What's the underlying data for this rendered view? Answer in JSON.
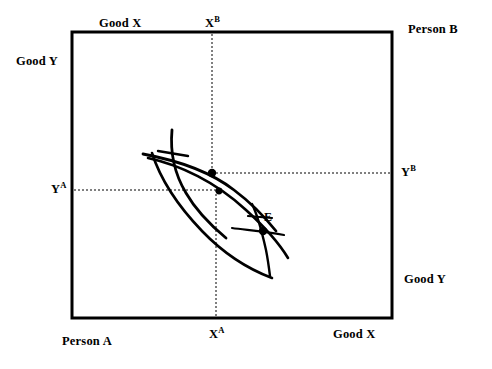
{
  "figure": {
    "type": "edgeworth-box",
    "background_color": "#ffffff",
    "stroke_color": "#000000"
  },
  "box": {
    "left": 72,
    "top": 32,
    "right": 392,
    "bottom": 318,
    "border_width": 3
  },
  "labels": {
    "good_x_top": "Good X",
    "x_b": "X",
    "x_b_sup": "B",
    "person_b": "Person B",
    "good_y_left": "Good Y",
    "y_a": "Y",
    "y_a_sup": "A",
    "y_b": "Y",
    "y_b_sup": "B",
    "equilibrium": "E",
    "good_y_right": "Good Y",
    "person_a": "Person A",
    "x_a": "X",
    "x_a_sup": "A",
    "good_x_bottom": "Good X"
  },
  "guides": {
    "x_b_line_x": 212,
    "x_a_line_x": 216,
    "y_a_line_y": 190,
    "y_b_line_y": 173,
    "dash_pattern": "2,2",
    "dash_width": 1
  },
  "points": [
    {
      "name": "tangency-upper",
      "x": 212,
      "y": 173,
      "r": 4.2
    },
    {
      "name": "tangency-lower",
      "x": 219,
      "y": 191,
      "r": 3.4
    },
    {
      "name": "equilibrium-E",
      "x": 263,
      "y": 231,
      "r": 4.2
    }
  ],
  "curves": [
    {
      "name": "indifference-curve-a-outer",
      "path": "M 148 158 C 180 165, 216 182, 246 210 C 268 230, 282 248, 288 258"
    },
    {
      "name": "indifference-curve-b-outer",
      "path": "M 152 153 C 160 178, 178 206, 202 231 C 228 258, 256 272, 272 278"
    },
    {
      "name": "indifference-curve-a-inner",
      "path": "M 143 154 C 175 160, 208 170, 234 190 C 254 205, 268 221, 276 231"
    },
    {
      "name": "indifference-curve-b-inner",
      "path": "M 172 130 C 170 152, 174 173, 186 193 C 198 214, 214 228, 226 238"
    },
    {
      "name": "price-line-through-E",
      "path": "M 232 228 C 246 230, 262 231, 284 235"
    },
    {
      "name": "curve-through-E-steep",
      "path": "M 252 204 C 257 214, 262 232, 266 250 C 268 260, 269 268, 270 276"
    },
    {
      "name": "tick-upper-left",
      "path": "M 158 151 L 188 156"
    },
    {
      "name": "tick-inner-right",
      "path": "M 248 216 L 272 218"
    }
  ],
  "axis_hint": {
    "x_axis_top_direction": "Good X increases leftward for Person B",
    "y_axis_left_direction": "Good Y for Person A"
  }
}
